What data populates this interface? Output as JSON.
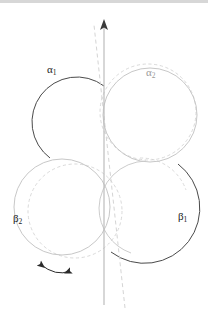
{
  "figure": {
    "width": 208,
    "height": 321,
    "background": "#ffffff",
    "top_rule_color": "#d7d7d7"
  },
  "colors": {
    "dark_stroke": "#3a3a3a",
    "grey_stroke": "#c6c6c6",
    "dashed_stroke": "#cfcfcf",
    "axis_solid": "#bdbdbd",
    "axis_dashed": "#cccccc",
    "arrow_dark": "#2a2a2a",
    "label_dark": "#1a1a1a",
    "label_grey": "#9a9a9a"
  },
  "labels": [
    {
      "id": "alpha1",
      "text": "α",
      "sub": "1",
      "x": 47,
      "y": 64,
      "tone": "dark"
    },
    {
      "id": "alpha2",
      "text": "α",
      "sub": "2",
      "x": 146,
      "y": 67,
      "tone": "grey"
    },
    {
      "id": "beta2",
      "text": "β",
      "sub": "2",
      "x": 13,
      "y": 213,
      "tone": "dark"
    },
    {
      "id": "beta1",
      "text": "β",
      "sub": "1",
      "x": 178,
      "y": 211,
      "tone": "dark"
    }
  ],
  "circles": [
    {
      "id": "alpha1-circle",
      "label": "alpha1",
      "cx": 59,
      "cy": 117,
      "r": 45,
      "style": "solid-dark",
      "arc": "open-right"
    },
    {
      "id": "alpha2-circle",
      "label": "alpha2",
      "cx": 150,
      "cy": 115,
      "r": 47,
      "style": "solid-grey",
      "arc": "full"
    },
    {
      "id": "alpha2-ghost",
      "label": "alpha2",
      "cx": 148,
      "cy": 112,
      "r": 48,
      "style": "dashed-grey",
      "arc": "full"
    },
    {
      "id": "beta2-circle",
      "label": "beta2",
      "cx": 62,
      "cy": 207,
      "r": 48,
      "style": "solid-grey",
      "arc": "full"
    },
    {
      "id": "beta2-ghost",
      "label": "beta2",
      "cx": 75,
      "cy": 211,
      "r": 47,
      "style": "dashed-grey",
      "arc": "full"
    },
    {
      "id": "beta1-circle",
      "label": "beta1",
      "cx": 146,
      "cy": 209,
      "r": 48,
      "style": "solid-dark",
      "arc": "open-left"
    },
    {
      "id": "beta1-ghost",
      "label": "beta1",
      "cx": 140,
      "cy": 206,
      "r": 48,
      "style": "dashed-grey",
      "arc": "partial"
    }
  ],
  "axes": [
    {
      "id": "vertical-axis",
      "kind": "solid-arrow",
      "x1": 104,
      "y1": 305,
      "x2": 104,
      "y2": 22,
      "arrowhead": "top",
      "color": "#bdbdbd"
    },
    {
      "id": "tilted-axis",
      "kind": "dashed",
      "x1": 125,
      "y1": 308,
      "x2": 94,
      "y2": 25,
      "arrowhead": "none",
      "color": "#cccccc"
    }
  ],
  "rotation_arrow": {
    "id": "rotation-indicator",
    "kind": "double-headed-curved",
    "from_x": 37,
    "from_y": 262,
    "to_x": 73,
    "to_y": 273,
    "control_x": 55,
    "control_y": 276,
    "color": "#2a2a2a"
  }
}
